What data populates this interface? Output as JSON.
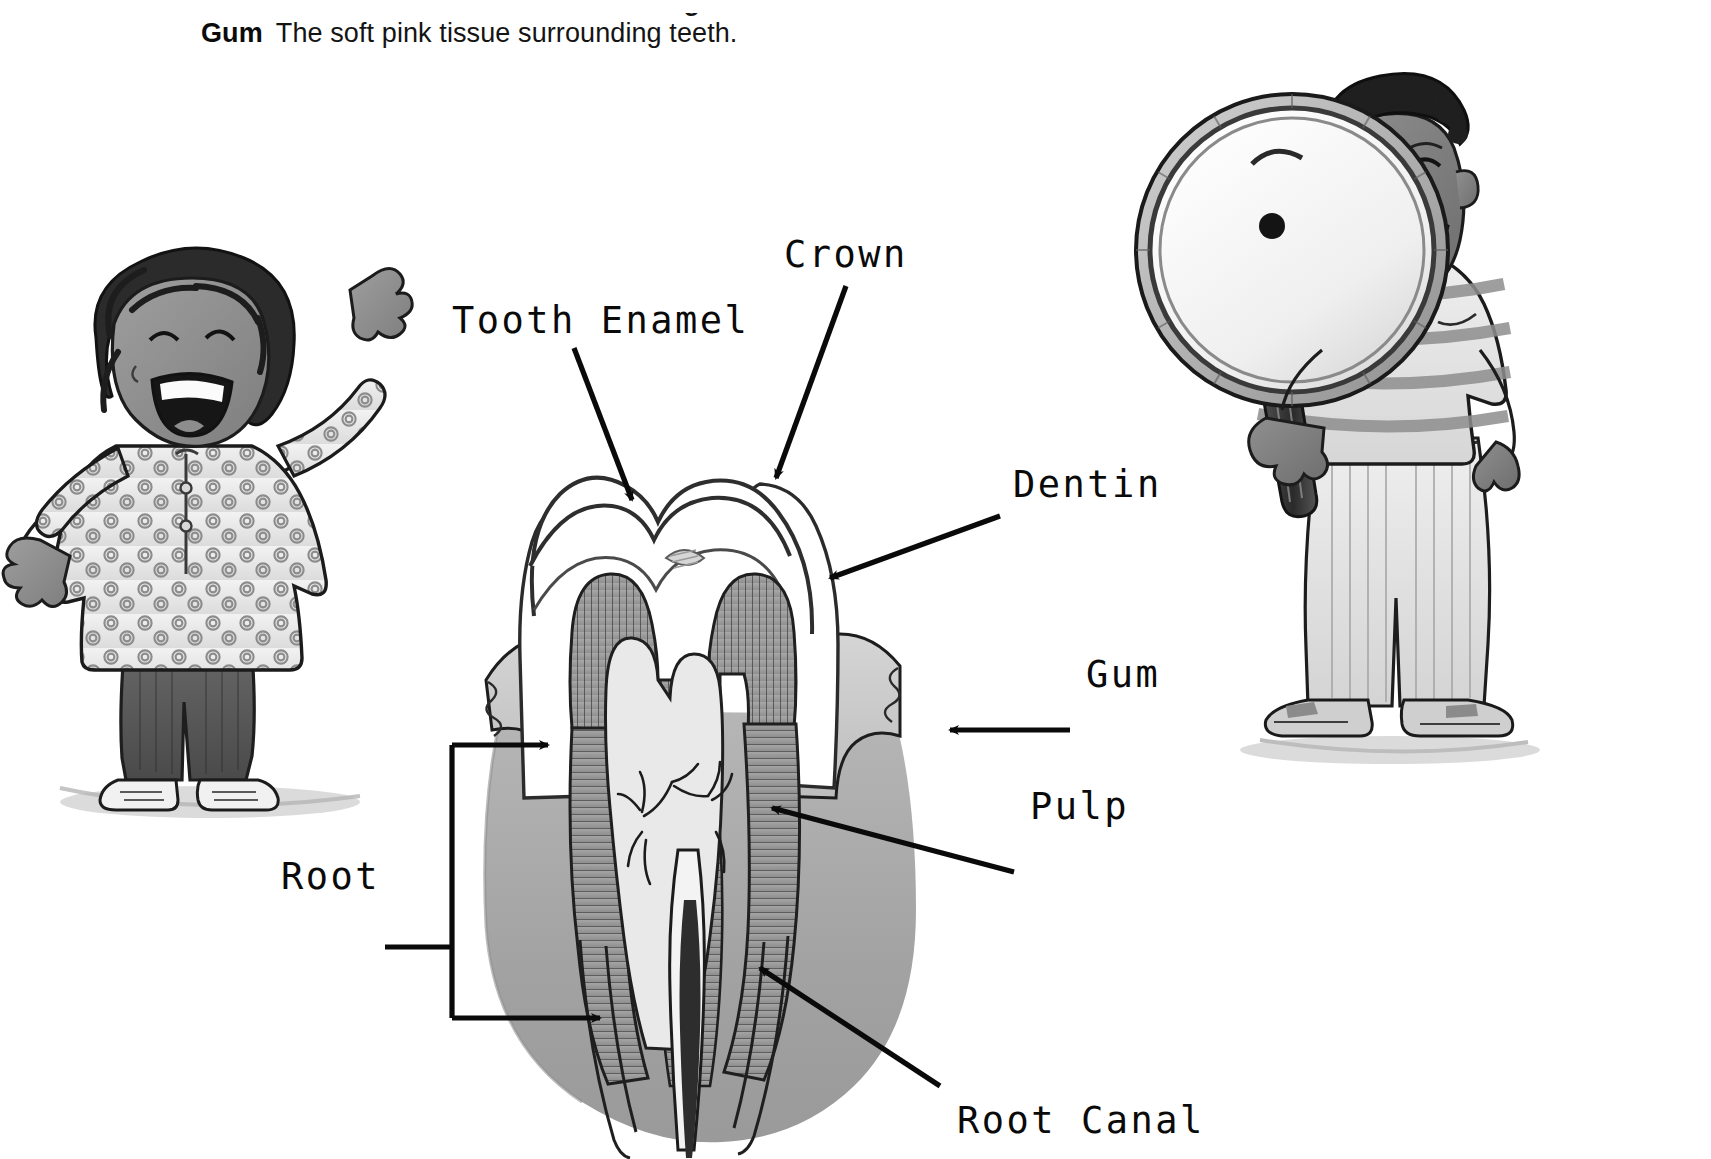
{
  "page": {
    "background_color": "#ffffff",
    "width": 1711,
    "height": 1159,
    "clipped_text_above": "Tooth Enamel   The hard outer covering"
  },
  "glossary": {
    "term": "Gum",
    "definition": "The soft pink tissue surrounding teeth."
  },
  "diagram": {
    "labels": [
      {
        "id": "tooth-enamel",
        "text": "Tooth Enamel",
        "x": 452,
        "y": 305
      },
      {
        "id": "crown",
        "text": "Crown",
        "x": 784,
        "y": 240
      },
      {
        "id": "dentin",
        "text": "Dentin",
        "x": 1013,
        "y": 470
      },
      {
        "id": "gum",
        "text": "Gum",
        "x": 1086,
        "y": 658
      },
      {
        "id": "pulp",
        "text": "Pulp",
        "x": 1030,
        "y": 792
      },
      {
        "id": "root",
        "text": "Root",
        "x": 281,
        "y": 860
      },
      {
        "id": "root-canal",
        "text": "Root Canal",
        "x": 957,
        "y": 1106
      }
    ],
    "parts": [
      "enamel",
      "crown",
      "dentin",
      "pulp chamber",
      "gum",
      "root",
      "root canal",
      "bone"
    ]
  },
  "illustrations": {
    "left_child": {
      "name": "girl-waving",
      "description": "Girl with dark curly hair waving both arms, floral patterned tunic, dark trousers, sneakers"
    },
    "right_child": {
      "name": "boy-with-magnifier",
      "description": "Boy holding a large magnifying glass up to his face, striped t-shirt, light trousers, shoes"
    }
  },
  "colors": {
    "ink": "#0a0a0a",
    "paper": "#ffffff",
    "dentin_gray": "#9d9d9d",
    "gum_gray": "#c9c9c9",
    "bone_gray": "#a6a6a6",
    "pulp_light": "#e8e8e8",
    "skin_gray": "#8e8e8e",
    "hair_dark": "#2b2b2b"
  }
}
